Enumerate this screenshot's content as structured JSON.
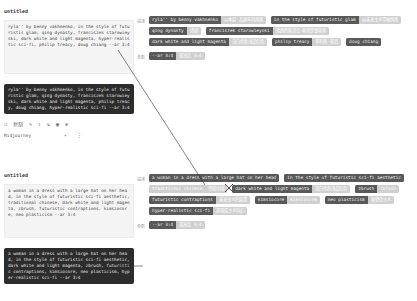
{
  "cards": [
    {
      "title": "untitled",
      "prompt": "ryla'' by benny vakhnenko, in the style of futuristic glam, qing dynasty, franciszek starowieyski, dark white and light magenta, hyper-realistic sci-fi, philip treacy, doug chiang --ar 3:4",
      "output": "ryla'' by benny vakhnenko, in the style of futuristic glam, qing dynasty, franciszek starowieyski, dark white and light magenta, philip treacy, doug chiang, hyper-realistic sci-fi --ar 3:4",
      "toolbar": {
        "copy_label": "复制",
        "model": "Midjourney"
      }
    },
    {
      "title": "untitled",
      "prompt": "a woman in a dress with a large hat on her head, in the style of futuristic sci-fi aesthetic, traditional chinese, dark white and light magenta, zbrush, futuristic contraptions, kimsiocore, neo plasticism --ar 3:4",
      "output": "a woman in a dress with a large hat on her head, in the style of futuristic sci-fi aesthetic, dark white and light magenta, zbrush, futuristic contraptions, kimsiocore, neo plasticism, hyper-realistic sci-fi --ar 3:4"
    }
  ],
  "sections": [
    {
      "rows": [
        {
          "label": "描述",
          "tags": [
            {
              "en": "ryla'' by benny vakhnenko",
              "zh": "以本尼·瓦赫年科风格"
            },
            {
              "en": "in the style of futuristic glam",
              "zh": "以未来主义华丽风格"
            },
            {
              "en": "qing dynasty",
              "zh": "清朝"
            },
            {
              "en": "franciszek starowieyski",
              "zh": "弗朗西斯泽克·斯塔罗维斯基"
            },
            {
              "en": "dark white and light magenta",
              "zh": "深白色和浅品红色"
            },
            {
              "en": "philip treacy",
              "zh": "菲利普·崔西"
            },
            {
              "en": "doug chiang",
              "zh": ""
            }
          ]
        },
        {
          "label": "参数",
          "tags": [
            {
              "en": "--ar 3:4",
              "zh": "宽高比 3:4"
            }
          ]
        }
      ]
    },
    {
      "rows": [
        {
          "label": "描述",
          "tags": [
            {
              "en": "a woman in a dress with a large hat on her head",
              "zh": ""
            },
            {
              "en": "in the style of futuristic sci-fi aesthetic",
              "zh": ""
            },
            {
              "en": "traditional chinese",
              "zh": "传统中国",
              "light": true
            },
            {
              "en": "dark white and light magenta",
              "zh": "深白色和浅品红色"
            },
            {
              "en": "zbrush",
              "zh": "zbrush"
            },
            {
              "en": "futuristic contraptions",
              "zh": "未来主义的装置"
            },
            {
              "en": "kimsiocore",
              "zh": "kimsiocore"
            },
            {
              "en": "neo plasticism",
              "zh": "新塑造主义"
            },
            {
              "en": "hyper-realistic sci-fi",
              "zh": "超现实主义科幻"
            }
          ]
        },
        {
          "label": "参数",
          "tags": [
            {
              "en": "--ar 3:4",
              "zh": "宽高比 3:4"
            }
          ]
        }
      ]
    }
  ]
}
